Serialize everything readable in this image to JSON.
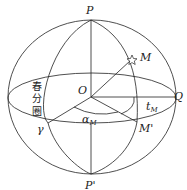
{
  "labels": {
    "north_pole": "P",
    "south_pole": "P'",
    "center": "O",
    "star": "M",
    "projection": "M'",
    "equator_point": "Q",
    "vernal_equinox": "γ",
    "equinoctial_colure": [
      "春",
      "分",
      "圈"
    ],
    "right_ascension": "α",
    "right_ascension_sub": "M",
    "hour_angle": "t",
    "hour_angle_sub": "M"
  },
  "colors": {
    "line": "#222222",
    "background": "#ffffff"
  }
}
